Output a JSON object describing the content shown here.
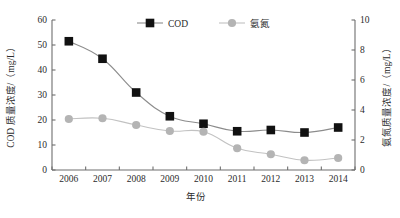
{
  "chart_data": {
    "type": "line",
    "title": "",
    "xlabel": "年份",
    "ylabel": "COD 质量浓度/（mg/L）",
    "y2label": "氨氮质量浓度/（mg/L）",
    "categories": [
      "2006",
      "2007",
      "2008",
      "2009",
      "2010",
      "2011",
      "2012",
      "2013",
      "2014"
    ],
    "x_tick_labels": [
      "2006",
      "2007",
      "2008",
      "2009",
      "2010",
      "2011",
      "2012",
      "2013",
      "2014"
    ],
    "y_tick_labels": [
      "0",
      "10",
      "20",
      "30",
      "40",
      "50",
      "60"
    ],
    "y_ticks": [
      0,
      10,
      20,
      30,
      40,
      50,
      60
    ],
    "ylim": [
      0,
      60
    ],
    "y2_tick_labels": [
      "0",
      "2",
      "4",
      "6",
      "8",
      "10"
    ],
    "y2_ticks": [
      0,
      2,
      4,
      6,
      8,
      10
    ],
    "y2lim": [
      0,
      10
    ],
    "grid": false,
    "legend_position": "top-center",
    "series": [
      {
        "name": "COD",
        "axis": "left",
        "marker": "square",
        "color": "#111111",
        "line_color": "#8c8c8c",
        "values": [
          51.5,
          44.5,
          31.0,
          21.5,
          18.5,
          15.5,
          16.0,
          15.0,
          17.0
        ]
      },
      {
        "name": "氨氮",
        "axis": "right",
        "marker": "circle",
        "color": "#b4b4b4",
        "line_color": "#c2c2c2",
        "values": [
          3.4,
          3.45,
          3.0,
          2.6,
          2.55,
          1.45,
          1.05,
          0.65,
          0.8
        ]
      }
    ]
  },
  "legend": {
    "items": [
      {
        "label": "COD"
      },
      {
        "label": "氨氮"
      }
    ]
  },
  "axes": {
    "left_title": "COD 质量浓度/（mg/L）",
    "right_title": "氨氮质量浓度/（mg/L）",
    "bottom_title": "年份"
  },
  "colors": {
    "cod_marker": "#111111",
    "cod_line": "#8c8c8c",
    "nh3_marker": "#b4b4b4",
    "nh3_line": "#c2c2c2",
    "axis": "#6e6e6e",
    "text": "#2b2b2b",
    "background": "#ffffff"
  }
}
